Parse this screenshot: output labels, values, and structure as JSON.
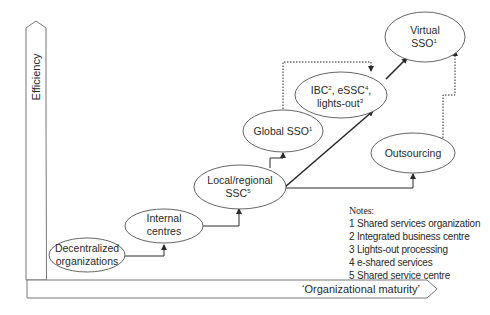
{
  "axes": {
    "y_label": "Efficiency",
    "x_label": "‘Organizational maturity’"
  },
  "nodes": [
    {
      "id": "decentralized",
      "lines": [
        "Decentralized",
        "organizations"
      ]
    },
    {
      "id": "internal",
      "lines": [
        "Internal",
        "centres"
      ]
    },
    {
      "id": "local",
      "lines": [
        "Local/regional",
        "SSC",
        "5"
      ]
    },
    {
      "id": "global",
      "lines": [
        "Global SSO",
        "1"
      ]
    },
    {
      "id": "ibc",
      "lines": [
        "IBC",
        "2",
        ", eSSC",
        "4",
        ",",
        "lights-out",
        "3"
      ]
    },
    {
      "id": "virtual",
      "lines": [
        "Virtual",
        "SSO",
        "1"
      ]
    },
    {
      "id": "outsourcing",
      "lines": [
        "Outsourcing"
      ]
    }
  ],
  "notes": {
    "title": "Notes:",
    "items": [
      "1 Shared services organization",
      "2 Integrated business centre",
      "3 Lights-out processing",
      "4 e-shared services",
      "5 Shared service centre"
    ]
  },
  "colors": {
    "line": "#3a3a3a",
    "axis": "#6a6a6a",
    "background": "#ffffff"
  }
}
